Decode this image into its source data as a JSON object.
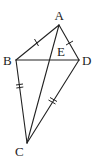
{
  "figure": {
    "type": "geometry-diagram",
    "points": {
      "A": {
        "label": "A",
        "x": 59,
        "y": 25
      },
      "B": {
        "label": "B",
        "x": 16,
        "y": 60
      },
      "C": {
        "label": "C",
        "x": 27,
        "y": 143
      },
      "D": {
        "label": "D",
        "x": 79,
        "y": 60
      },
      "E": {
        "label": "E"
      }
    },
    "segments": [
      "AB",
      "AD",
      "BC",
      "DC",
      "AC",
      "BD"
    ],
    "equal_marks": [
      {
        "segments": [
          "AB",
          "AD"
        ],
        "ticks": 1
      },
      {
        "segments": [
          "BC",
          "DC"
        ],
        "ticks": 2
      }
    ],
    "stroke_color": "#222222",
    "background": "#ffffff"
  }
}
